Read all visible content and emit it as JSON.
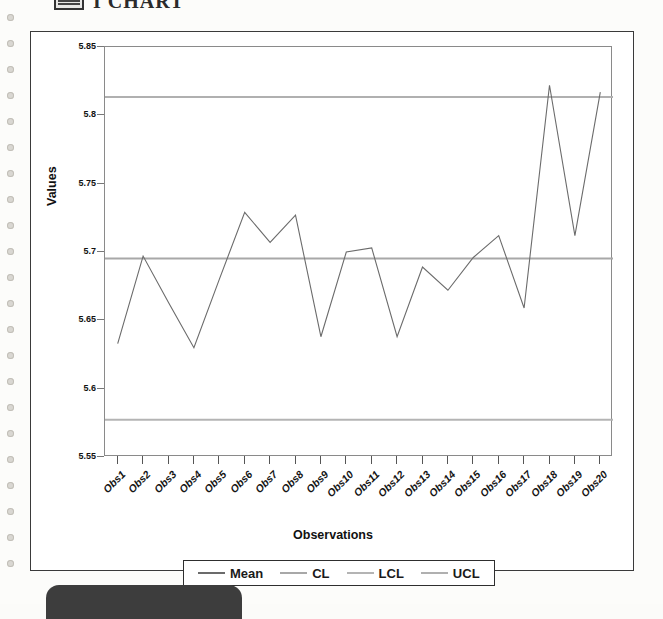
{
  "page": {
    "title": "I CHART",
    "title_icon": "chart-grid-icon",
    "binding_holes": 22
  },
  "chart_data": {
    "type": "line",
    "title": "",
    "xlabel": "Observations",
    "ylabel": "Values",
    "ylim": [
      5.55,
      5.85
    ],
    "ytick_labels": [
      "5.85",
      "5.8",
      "5.75",
      "5.7",
      "5.65",
      "5.6",
      "5.55"
    ],
    "ytick_values": [
      5.85,
      5.8,
      5.75,
      5.7,
      5.65,
      5.6,
      5.55
    ],
    "categories": [
      "Obs1",
      "Obs2",
      "Obs3",
      "Obs4",
      "Obs5",
      "Obs6",
      "Obs7",
      "Obs8",
      "Obs9",
      "Obs10",
      "Obs11",
      "Obs12",
      "Obs13",
      "Obs14",
      "Obs15",
      "Obs16",
      "Obs17",
      "Obs18",
      "Obs19",
      "Obs20"
    ],
    "grid": false,
    "legend_position": "bottom",
    "series": [
      {
        "name": "Mean",
        "kind": "data",
        "color": "#6b6b6b",
        "values": [
          5.633,
          5.697,
          5.663,
          5.63,
          5.68,
          5.729,
          5.707,
          5.727,
          5.638,
          5.7,
          5.703,
          5.638,
          5.689,
          5.672,
          5.696,
          5.712,
          5.659,
          5.822,
          5.712,
          5.817
        ]
      },
      {
        "name": "CL",
        "kind": "control-limit",
        "color": "#a8a8a8",
        "value": 5.6953
      },
      {
        "name": "LCL",
        "kind": "control-limit",
        "color": "#b4b4b4",
        "value": 5.5772
      },
      {
        "name": "UCL",
        "kind": "control-limit",
        "color": "#b0b0b0",
        "value": 5.8135
      }
    ],
    "legend": [
      {
        "label": "Mean",
        "color": "#6b6b6b"
      },
      {
        "label": "CL",
        "color": "#a8a8a8"
      },
      {
        "label": "LCL",
        "color": "#b4b4b4"
      },
      {
        "label": "UCL",
        "color": "#b0b0b0"
      }
    ]
  }
}
